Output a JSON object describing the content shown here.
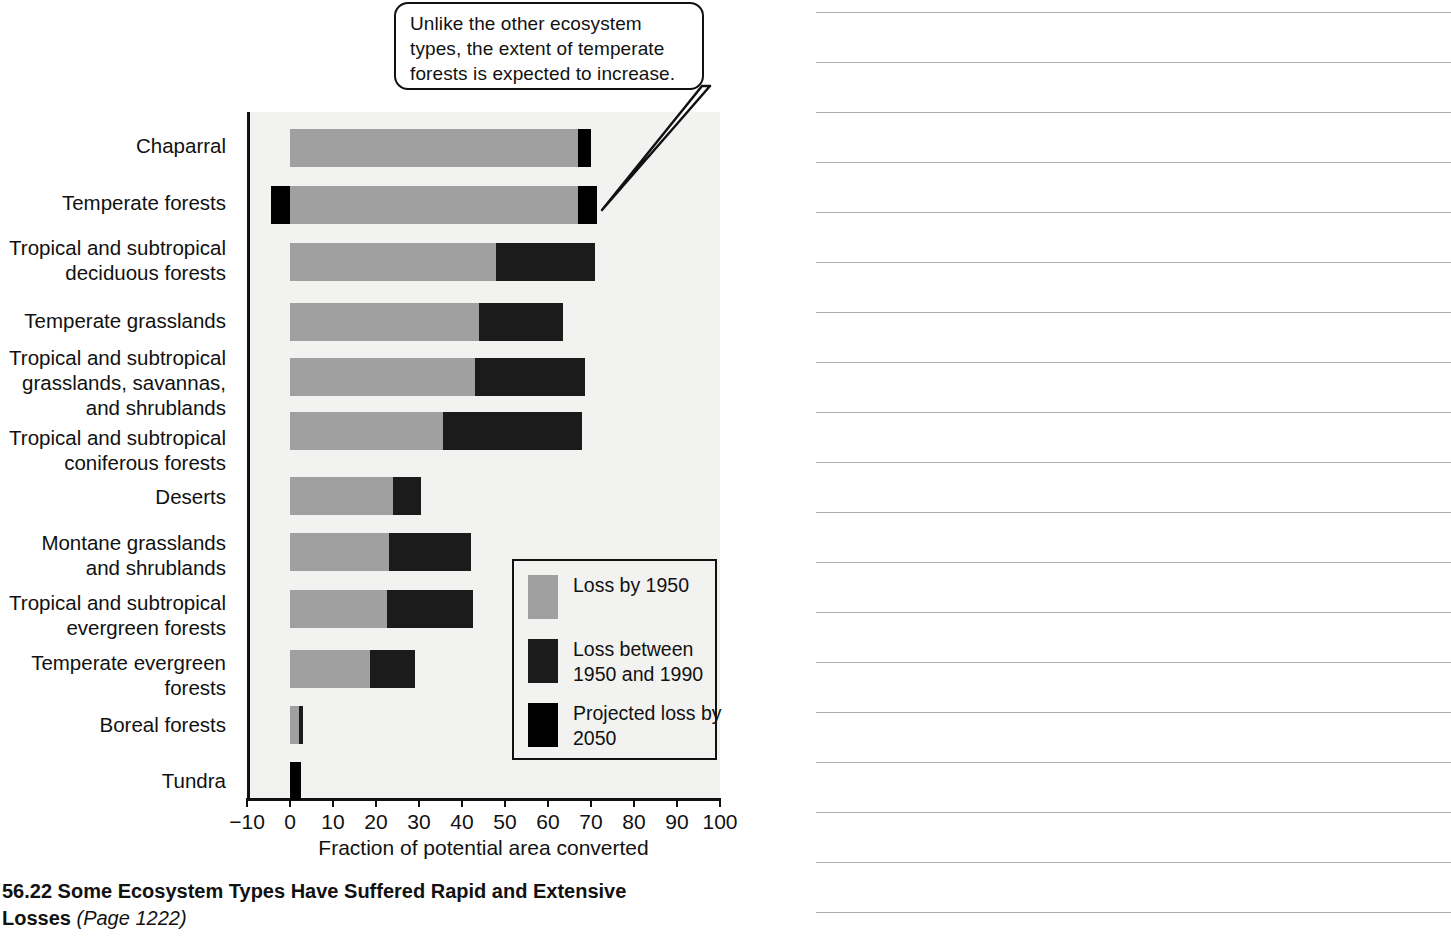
{
  "figure": {
    "caption_main": "56.22  Some Ecosystem Types Have Suffered Rapid and Extensive Losses",
    "caption_page": "(Page 1222)",
    "callout_text": "Unlike the other ecosystem types, the extent of temperate forests is expected to increase."
  },
  "legend": {
    "items": [
      {
        "label": "Loss by 1950",
        "color": "#a0a0a0"
      },
      {
        "label": "Loss between 1950 and 1990",
        "color": "#1b1b1b"
      },
      {
        "label": "Projected loss by 2050",
        "color": "#000000"
      }
    ]
  },
  "chart_data": {
    "type": "bar",
    "orientation": "horizontal",
    "stacked": true,
    "title": "",
    "xlabel": "Fraction of potential area converted",
    "ylabel": "",
    "xlim": [
      -10,
      100
    ],
    "xticks": [
      -10,
      0,
      10,
      20,
      30,
      40,
      50,
      60,
      70,
      80,
      90,
      100
    ],
    "xticklabels": [
      "−10",
      "0",
      "10",
      "20",
      "30",
      "40",
      "50",
      "60",
      "70",
      "80",
      "90",
      "100"
    ],
    "grid": false,
    "legend_position": "inside-lower-right",
    "categories": [
      "Chaparral",
      "Temperate forests",
      "Tropical and subtropical deciduous forests",
      "Temperate grasslands",
      "Tropical and subtropical grasslands, savannas, and shrublands",
      "Tropical and subtropical coniferous forests",
      "Deserts",
      "Montane grasslands and shrublands",
      "Tropical and subtropical evergreen forests",
      "Temperate evergreen forests",
      "Boreal forests",
      "Tundra"
    ],
    "series": [
      {
        "name": "Loss by 1950",
        "values": [
          67,
          67,
          48,
          44,
          43,
          35.5,
          24,
          23,
          22.5,
          18.5,
          2,
          0
        ]
      },
      {
        "name": "Loss between 1950 and 1990",
        "values": [
          0,
          0,
          23,
          19.5,
          25.5,
          32.5,
          6.5,
          19,
          20,
          10.5,
          1,
          0
        ]
      },
      {
        "name": "Projected loss by 2050",
        "values": [
          3,
          4.5,
          0,
          0,
          0,
          0,
          0,
          0,
          0,
          0,
          0,
          2.5
        ]
      }
    ],
    "negative_segments": [
      {
        "category": "Temperate forests",
        "series": "Projected loss by 2050",
        "from": -4.5,
        "to": 0
      }
    ],
    "annotations": [
      {
        "text": "Unlike the other ecosystem types, the extent of temperate forests is expected to increase.",
        "points_to": "Temperate forests"
      }
    ]
  },
  "labels": {
    "chaparral": "Chaparral",
    "temperate_forests": "Temperate forests",
    "trop_decid_1": "Tropical and subtropical",
    "trop_decid_2": "deciduous forests",
    "temperate_grasslands": "Temperate grasslands",
    "trop_grass_1": "Tropical and subtropical",
    "trop_grass_2": "grasslands, savannas,",
    "trop_grass_3": "and shrublands",
    "trop_conif_1": "Tropical and subtropical",
    "trop_conif_2": "coniferous forests",
    "deserts": "Deserts",
    "montane_1": "Montane grasslands",
    "montane_2": "and shrublands",
    "trop_ever_1": "Tropical and subtropical",
    "trop_ever_2": "evergreen forests",
    "temp_ever_1": "Temperate evergreen",
    "temp_ever_2": "forests",
    "boreal": "Boreal forests",
    "tundra": "Tundra"
  },
  "notes": {
    "line_count": 19
  }
}
